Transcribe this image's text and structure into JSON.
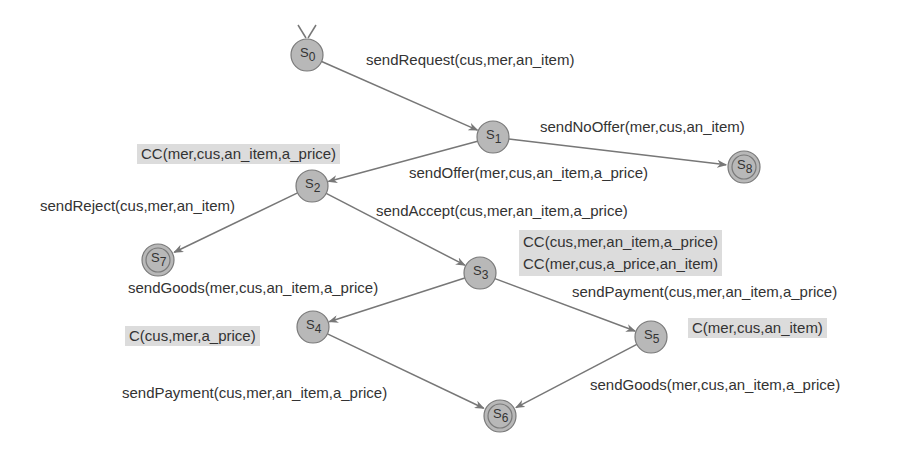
{
  "colors": {
    "node_fill": "#b8b8b8",
    "node_stroke": "#7a7a7a",
    "edge": "#777777",
    "annotation_bg": "#dcdcdc",
    "text": "#333333"
  },
  "states": [
    {
      "id": "s0",
      "label": "S",
      "sub": "0",
      "x": 307,
      "y": 55,
      "final": false,
      "initial": true
    },
    {
      "id": "s1",
      "label": "S",
      "sub": "1",
      "x": 493,
      "y": 137,
      "final": false
    },
    {
      "id": "s2",
      "label": "S",
      "sub": "2",
      "x": 312,
      "y": 186,
      "final": false
    },
    {
      "id": "s3",
      "label": "S",
      "sub": "3",
      "x": 480,
      "y": 273,
      "final": false
    },
    {
      "id": "s4",
      "label": "S",
      "sub": "4",
      "x": 313,
      "y": 327,
      "final": false
    },
    {
      "id": "s5",
      "label": "S",
      "sub": "5",
      "x": 651,
      "y": 337,
      "final": false
    },
    {
      "id": "s6",
      "label": "S",
      "sub": "6",
      "x": 500,
      "y": 416,
      "final": true
    },
    {
      "id": "s7",
      "label": "S",
      "sub": "7",
      "x": 158,
      "y": 260,
      "final": true
    },
    {
      "id": "s8",
      "label": "S",
      "sub": "8",
      "x": 744,
      "y": 167,
      "final": true
    }
  ],
  "transitions": [
    {
      "from": "s0",
      "to": "s1",
      "label": "sendRequest(cus,mer,an_item)"
    },
    {
      "from": "s1",
      "to": "s8",
      "label": "sendNoOffer(mer,cus,an_item)"
    },
    {
      "from": "s1",
      "to": "s2",
      "label": "sendOffer(mer,cus,an_item,a_price)"
    },
    {
      "from": "s2",
      "to": "s7",
      "label": "sendReject(cus,mer,an_item)"
    },
    {
      "from": "s2",
      "to": "s3",
      "label": "sendAccept(cus,mer,an_item,a_price)"
    },
    {
      "from": "s3",
      "to": "s4",
      "label": "sendGoods(mer,cus,an_item,a_price)"
    },
    {
      "from": "s3",
      "to": "s5",
      "label": "sendPayment(cus,mer,an_item,a_price)"
    },
    {
      "from": "s4",
      "to": "s6",
      "label": "sendPayment(cus,mer,an_item,a_price)"
    },
    {
      "from": "s5",
      "to": "s6",
      "label": "sendGoods(mer,cus,an_item,a_price)"
    }
  ],
  "annotations": {
    "s2": [
      "CC(mer,cus,an_item,a_price)"
    ],
    "s3": [
      "CC(cus,mer,an_item,a_price)",
      "CC(mer,cus,a_price,an_item)"
    ],
    "s4": [
      "C(cus,mer,a_price)"
    ],
    "s5": [
      "C(mer,cus,an_item)"
    ]
  }
}
